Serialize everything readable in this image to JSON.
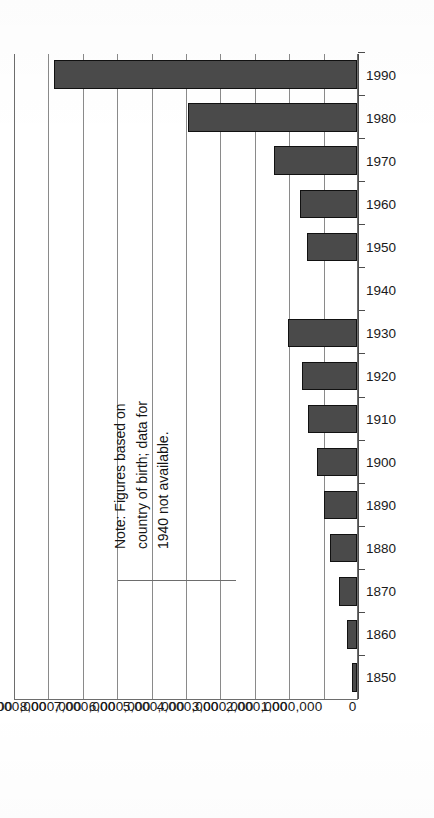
{
  "chart_data": {
    "type": "bar",
    "orientation": "vertical-printed-rotated",
    "title": "",
    "xlabel": "",
    "ylabel": "",
    "ylim": [
      0,
      10000000
    ],
    "ytick_step": 1000000,
    "grid": true,
    "legend": false,
    "categories": [
      "1850",
      "1860",
      "1870",
      "1880",
      "1890",
      "1900",
      "1910",
      "1920",
      "1930",
      "1940",
      "1950",
      "1960",
      "1970",
      "1980",
      "1990"
    ],
    "values": [
      150000,
      290000,
      520000,
      780000,
      960000,
      1160000,
      1420000,
      1600000,
      2000000,
      null,
      1450000,
      1650000,
      2400000,
      4900000,
      8800000
    ],
    "ytick_labels": [
      "10,000,000",
      "9,000,000",
      "8,000,000",
      "7,000,000",
      "6,000,000",
      "5,000,000",
      "4,000,000",
      "3,000,000",
      "2,000,000",
      "1,000,000",
      "0"
    ],
    "ytick_values": [
      10000000,
      9000000,
      8000000,
      7000000,
      6000000,
      5000000,
      4000000,
      3000000,
      2000000,
      1000000,
      0
    ],
    "missing_categories": [
      "1940"
    ],
    "annotations": [
      "Note: Figures based on",
      "country of birth; data for",
      "1940 not available."
    ],
    "colors": {
      "bar_fill": "#4a4a4a",
      "bar_stroke": "#111111",
      "gridline": "#8a8a8a",
      "axis": "#4d4d4d",
      "background": "#ffffff",
      "text": "#141414"
    }
  },
  "note": {
    "line1": "Note: Figures based on",
    "line2": "country of birth; data for",
    "line3": "1940 not available."
  }
}
